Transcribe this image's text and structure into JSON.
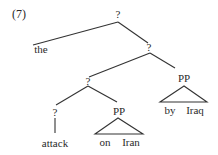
{
  "example_number": "(7)",
  "tree": {
    "root": "?",
    "the": "the",
    "level2": "?",
    "level3": "?",
    "pp_right": "PP",
    "level4": "?",
    "pp_left": "PP",
    "attack": "attack",
    "on": "on",
    "iran": "Iran",
    "by": "by",
    "iraq": "Iraq"
  },
  "line_color": "#333333"
}
